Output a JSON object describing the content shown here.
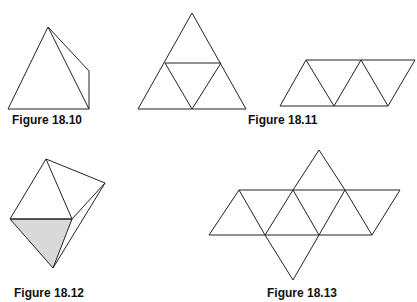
{
  "figures": [
    {
      "id": "fig-18-10",
      "caption": "Figure 18.10",
      "description": "Tetrahedron (triangular pyramid)"
    },
    {
      "id": "fig-18-11",
      "caption": "Figure 18.11",
      "description": "Net of tetrahedron: large triangle subdivided into 4 triangles, and a parallelogram strip of 4 triangles"
    },
    {
      "id": "fig-18-12",
      "caption": "Figure 18.12",
      "description": "Octahedron-like solid with one shaded face"
    },
    {
      "id": "fig-18-13",
      "caption": "Figure 18.13",
      "description": "Net of octahedron: 8 equilateral triangles"
    }
  ],
  "colors": {
    "line": "#222222",
    "shade": "#d9d9d9",
    "caption": "#111111"
  }
}
